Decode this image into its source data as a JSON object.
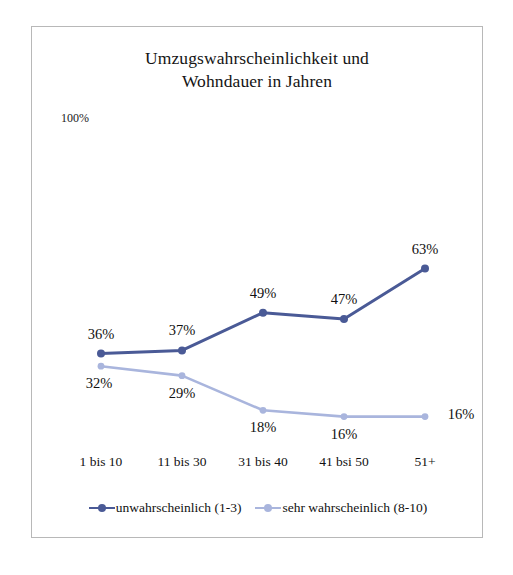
{
  "chart_data": {
    "type": "line",
    "title": "Umzugswahrscheinlichkeit und\nWohndauer in Jahren",
    "xlabel": "",
    "ylabel": "",
    "ylim": [
      0,
      100
    ],
    "y_axis_max_label": "100%",
    "grid": false,
    "legend_position": "bottom",
    "categories": [
      "1 bis 10",
      "11 bis 30",
      "31 bis 40",
      "41 bsi 50",
      "51+"
    ],
    "series": [
      {
        "name": "unwahrscheinlich (1-3)",
        "color": "#4a5a96",
        "values": [
          36,
          37,
          49,
          47,
          63
        ],
        "labels": [
          "36%",
          "37%",
          "49%",
          "47%",
          "63%"
        ],
        "label_position": "above"
      },
      {
        "name": "sehr wahrscheinlich (8-10)",
        "color": "#a9b5dd",
        "values": [
          32,
          29,
          18,
          16,
          16
        ],
        "labels": [
          "32%",
          "29%",
          "18%",
          "16%",
          "16%"
        ],
        "label_position": "below"
      }
    ]
  },
  "frame": {
    "border_color": "#b8b8b8",
    "background": "#ffffff"
  }
}
